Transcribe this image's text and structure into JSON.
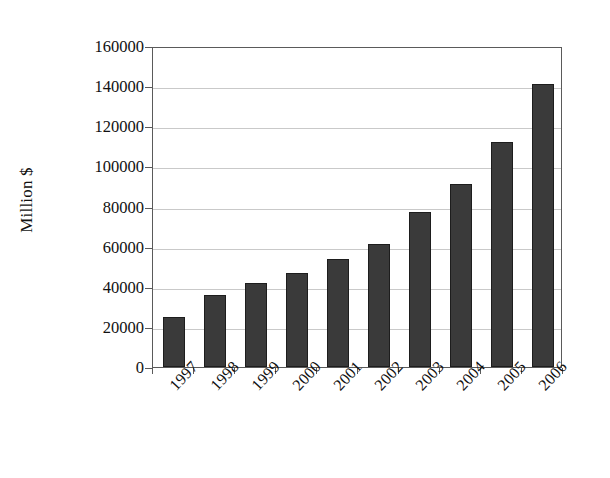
{
  "chart_data": {
    "type": "bar",
    "title": "",
    "subtitle": "",
    "xlabel": "",
    "ylabel": "Million $",
    "categories": [
      "1997",
      "1998",
      "1999",
      "2000",
      "2001",
      "2002",
      "2003",
      "2004",
      "2005",
      "2006"
    ],
    "values": [
      25000,
      36000,
      42000,
      47000,
      54000,
      61500,
      77500,
      91000,
      112000,
      141000
    ],
    "series": [
      {
        "name": "Million $",
        "values": [
          25000,
          36000,
          42000,
          47000,
          54000,
          61500,
          77500,
          91000,
          112000,
          141000
        ]
      }
    ],
    "ylim": [
      0,
      160000
    ],
    "ytick_values": [
      0,
      20000,
      40000,
      60000,
      80000,
      100000,
      120000,
      140000,
      160000
    ],
    "ytick_labels": [
      "0",
      "20000",
      "40000",
      "60000",
      "80000",
      "100000",
      "120000",
      "140000",
      "160000"
    ],
    "grid": "horizontal",
    "legend": "none",
    "bar_color": "#3a3a3a",
    "bar_border_color": "#1d1d1d",
    "gridline_color": "#c9c9c9",
    "axis_color": "#5a5a5a",
    "background_color": "#ffffff",
    "xtick_label_rotation": -47
  }
}
